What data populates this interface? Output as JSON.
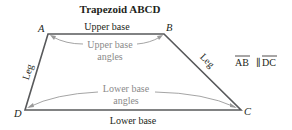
{
  "diagram": {
    "title": "Trapezoid ABCD",
    "vertices": {
      "A": {
        "label": "A",
        "x": 48,
        "y": 34
      },
      "B": {
        "label": "B",
        "x": 164,
        "y": 34
      },
      "C": {
        "label": "C",
        "x": 241,
        "y": 110
      },
      "D": {
        "label": "D",
        "x": 25,
        "y": 110
      }
    },
    "edge_labels": {
      "upper_base": "Upper base",
      "lower_base": "Lower base",
      "left_leg": "Leg",
      "right_leg": "Leg"
    },
    "angle_labels": {
      "upper_line1": "Upper base",
      "upper_line2": "angles",
      "lower_line1": "Lower base",
      "lower_line2": "angles"
    },
    "parallel_statement": {
      "left": "AB",
      "symbol": "∥",
      "right": "DC"
    },
    "colors": {
      "edge": "#58595b",
      "text": "#231f20",
      "angle_annotation": "#8a8a8a"
    }
  }
}
